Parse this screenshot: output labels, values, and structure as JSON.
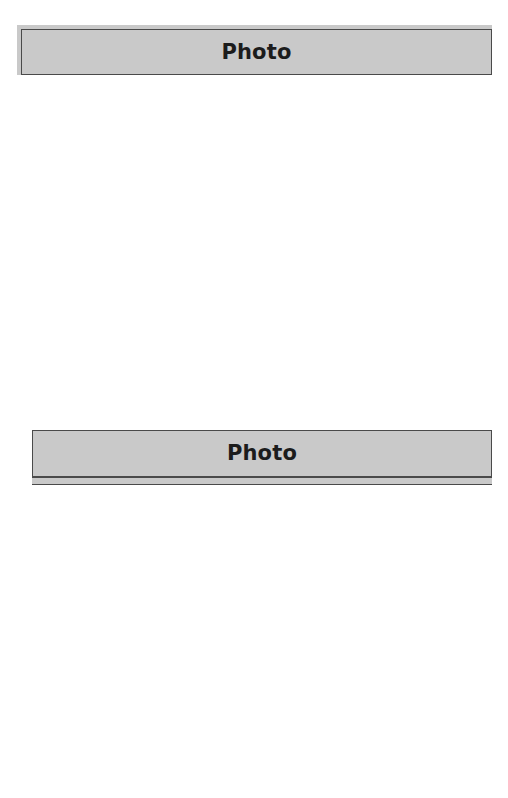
{
  "document": {
    "background_color": "#ffffff",
    "panel_count": 2
  },
  "panels": [
    {
      "id": "panel-one",
      "title": "Photo",
      "header_fill": "#c9c9c9",
      "border_color": "#8a8a8a",
      "body_fill": "#ffffff",
      "body_content": "",
      "state": "complete"
    },
    {
      "id": "panel-two",
      "title": "Photo",
      "header_fill": "#c9c9c9",
      "border_color": "#6e6e6e",
      "body_fill": "#ffffff",
      "body_content": "",
      "state": "clipped-at-page-bottom"
    }
  ]
}
